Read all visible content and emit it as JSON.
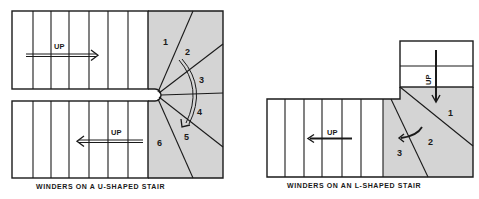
{
  "u_stair": {
    "caption": "WINDERS ON A U-SHAPED STAIR",
    "upper_flight_label": "UP",
    "lower_flight_label": "UP",
    "winder_numbers": [
      "1",
      "2",
      "3",
      "4",
      "5",
      "6"
    ],
    "upper_flight_treads": 7,
    "lower_flight_treads": 7
  },
  "l_stair": {
    "caption": "WINDERS ON AN L-SHAPED STAIR",
    "upper_flight_label": "UP",
    "lower_flight_label": "UP",
    "winder_numbers": [
      "1",
      "2",
      "3"
    ],
    "upper_flight_treads": 2,
    "lower_flight_treads": 6
  },
  "colors": {
    "line": "#1a1a1a",
    "winder_fill": "#d4d4d4",
    "background": "#ffffff"
  }
}
